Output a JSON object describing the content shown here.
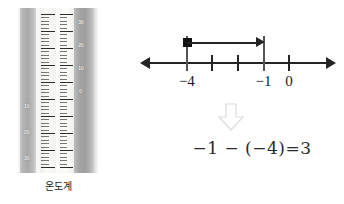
{
  "figure": {
    "title_alt": "number line subtraction with thermometer",
    "background_color": "#ffffff"
  },
  "thermometer": {
    "caption": "온도계",
    "celsius_scale_labels": [
      "30",
      "20",
      "10",
      "0",
      "-10",
      "-20",
      "-30"
    ],
    "celsius_scale_values": [
      30,
      20,
      10,
      0,
      -10,
      -20,
      -30
    ],
    "fahrenheit_like_labels": [
      "-10",
      "-20",
      "-30"
    ],
    "body_colors": {
      "casing_gray": "#a9a9a9",
      "scale_face": "#f6f6f3",
      "tick_dark": "#2b2b2b"
    }
  },
  "chart_data": {
    "type": "line",
    "title": "",
    "xlabel": "",
    "ylabel": "",
    "axis_range": [
      -5.6,
      1.6
    ],
    "tick_values": [
      -4,
      -3,
      -2,
      -1,
      0
    ],
    "tick_labels": [
      "−4",
      "",
      "",
      "−1",
      "0"
    ],
    "labeled_ticks": [
      {
        "value": -4,
        "label": "−4"
      },
      {
        "value": -1,
        "label": "−1"
      },
      {
        "value": 0,
        "label": "0"
      }
    ],
    "unlabeled_ticks": [
      -3,
      -2
    ],
    "guide_ticks": [
      -4,
      -1
    ],
    "jump": {
      "from": -4,
      "to": -1,
      "length": 3,
      "direction": "right",
      "start_marker": "filled-square",
      "end_marker": "arrowhead"
    },
    "axis_arrows": [
      "left",
      "right"
    ],
    "grid": false,
    "legend": null
  },
  "flow": {
    "arrow_icon": "down-block-arrow"
  },
  "equation": {
    "text": "−1 − (−4)=3",
    "left_operand": "−1",
    "operator": "−",
    "right_operand": "(−4)",
    "equals": "=",
    "result": "3"
  }
}
